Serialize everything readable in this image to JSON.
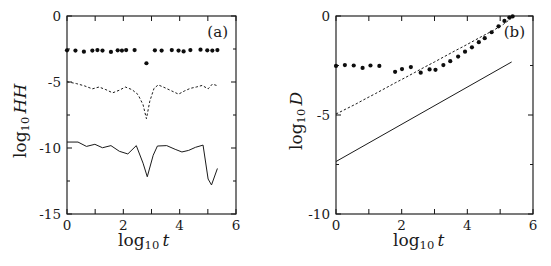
{
  "figure": {
    "width": 551,
    "height": 266,
    "background": "#ffffff",
    "ink_color": "#1a1a1a"
  },
  "chart_data": [
    {
      "type": "line",
      "panel_label": "(a)",
      "title": "",
      "xlabel": "log10 t",
      "ylabel": "log10 HH",
      "xlabel_text": "log",
      "xlabel_sub": "10",
      "xlabel_var": "t",
      "ylabel_text": "log",
      "ylabel_sub": "10",
      "ylabel_var": "HH",
      "xlim": [
        0,
        6
      ],
      "ylim": [
        -15,
        0
      ],
      "xticks": [
        0,
        1,
        2,
        3,
        4,
        5,
        6
      ],
      "xticklabels": [
        "0",
        "",
        "2",
        "",
        "4",
        "",
        "6"
      ],
      "yticks": [
        0,
        -5,
        -10,
        -15
      ],
      "yticklabels": [
        "0",
        "-5",
        "-10",
        "-15"
      ],
      "grid": false,
      "legend": null,
      "series": [
        {
          "name": "markers",
          "style": "scatter",
          "marker": "filled-circle",
          "x": [
            0.0,
            0.3,
            0.6,
            0.9,
            1.08,
            1.26,
            1.56,
            1.8,
            1.95,
            2.1,
            2.4,
            2.82,
            3.12,
            3.36,
            3.72,
            3.96,
            4.14,
            4.38,
            4.74,
            4.98,
            5.16,
            5.34
          ],
          "y": [
            -2.6,
            -2.62,
            -2.7,
            -2.62,
            -2.58,
            -2.62,
            -2.72,
            -2.6,
            -2.62,
            -2.58,
            -2.58,
            -3.58,
            -2.6,
            -2.62,
            -2.58,
            -2.62,
            -2.68,
            -2.58,
            -2.55,
            -2.6,
            -2.62,
            -2.58
          ]
        },
        {
          "name": "dashed-curve",
          "style": "dashed",
          "x": [
            0.0,
            0.33,
            0.63,
            0.9,
            1.14,
            1.38,
            1.62,
            1.86,
            2.07,
            2.31,
            2.52,
            2.7,
            2.82,
            2.94,
            3.09,
            3.24,
            3.48,
            3.72,
            3.96,
            4.17,
            4.38,
            4.59,
            4.8,
            5.01,
            5.16,
            5.31
          ],
          "y": [
            -4.98,
            -5.12,
            -5.3,
            -5.52,
            -5.38,
            -5.58,
            -5.82,
            -5.62,
            -5.38,
            -5.58,
            -5.95,
            -6.72,
            -7.78,
            -6.45,
            -5.48,
            -5.22,
            -5.44,
            -5.68,
            -5.92,
            -5.68,
            -5.48,
            -5.38,
            -5.26,
            -5.52,
            -5.16,
            -5.26
          ]
        },
        {
          "name": "solid-curve",
          "style": "solid",
          "x": [
            0.0,
            0.39,
            0.69,
            0.99,
            1.26,
            1.56,
            1.86,
            2.16,
            2.46,
            2.7,
            2.85,
            3.06,
            3.21,
            3.54,
            3.84,
            4.08,
            4.32,
            4.56,
            4.83,
            5.01,
            5.13,
            5.34
          ],
          "y": [
            -9.55,
            -9.55,
            -9.88,
            -9.72,
            -9.98,
            -9.82,
            -10.25,
            -10.45,
            -9.82,
            -11.15,
            -12.18,
            -10.55,
            -9.85,
            -9.82,
            -10.1,
            -10.3,
            -10.18,
            -9.95,
            -9.78,
            -12.35,
            -12.8,
            -11.55
          ]
        }
      ]
    },
    {
      "type": "line",
      "panel_label": "(b)",
      "title": "",
      "xlabel": "log10 t",
      "ylabel": "log10 D",
      "xlabel_text": "log",
      "xlabel_sub": "10",
      "xlabel_var": "t",
      "ylabel_text": "log",
      "ylabel_sub": "10",
      "ylabel_var": "D",
      "xlim": [
        0,
        6
      ],
      "ylim": [
        -10,
        0
      ],
      "xticks": [
        0,
        1,
        2,
        3,
        4,
        5,
        6
      ],
      "xticklabels": [
        "0",
        "",
        "2",
        "",
        "4",
        "",
        "6"
      ],
      "yticks": [
        0,
        -5,
        -10
      ],
      "yticklabels": [
        "0",
        "-5",
        "-10"
      ],
      "grid": false,
      "legend": null,
      "series": [
        {
          "name": "markers",
          "style": "scatter",
          "marker": "filled-circle",
          "x": [
            0.0,
            0.27,
            0.54,
            0.81,
            1.05,
            1.32,
            1.8,
            2.01,
            2.28,
            2.58,
            2.85,
            3.03,
            3.27,
            3.48,
            3.72,
            3.93,
            4.14,
            4.35,
            4.53,
            4.74,
            4.95,
            5.13,
            5.28,
            5.38
          ],
          "y": [
            -2.52,
            -2.48,
            -2.5,
            -2.62,
            -2.5,
            -2.52,
            -2.82,
            -2.68,
            -2.58,
            -2.86,
            -2.7,
            -2.72,
            -2.48,
            -2.28,
            -2.05,
            -1.8,
            -1.58,
            -1.32,
            -1.12,
            -0.82,
            -0.52,
            -0.25,
            -0.08,
            -0.02
          ]
        },
        {
          "name": "dashed-line",
          "style": "dashed",
          "x": [
            0.0,
            0.3,
            0.6,
            0.9,
            1.2,
            1.5,
            1.8,
            2.1,
            2.4,
            2.7,
            3.0,
            3.3,
            3.6,
            3.9,
            4.2,
            4.5,
            4.8,
            5.1,
            5.35
          ],
          "y": [
            -4.95,
            -4.7,
            -4.45,
            -4.18,
            -3.92,
            -3.65,
            -3.38,
            -3.12,
            -2.85,
            -2.58,
            -2.32,
            -2.05,
            -1.78,
            -1.52,
            -1.25,
            -0.98,
            -0.72,
            -0.42,
            -0.1
          ]
        },
        {
          "name": "solid-line",
          "style": "solid",
          "x": [
            0.0,
            5.35
          ],
          "y": [
            -7.35,
            -2.32
          ]
        }
      ]
    }
  ]
}
